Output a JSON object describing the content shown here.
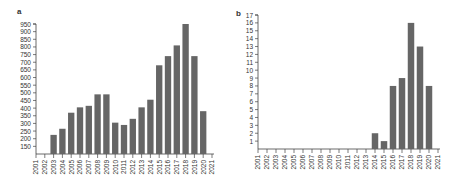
{
  "chart_data": [
    {
      "panel": "a",
      "type": "bar",
      "title": "",
      "xlabel": "",
      "ylabel": "",
      "categories": [
        "2001",
        "2002",
        "2003",
        "2004",
        "2005",
        "2006",
        "2007",
        "2008",
        "2009",
        "2010",
        "2011",
        "2012",
        "2013",
        "2014",
        "2015",
        "2016",
        "2017",
        "2018",
        "2019",
        "2020",
        "2021"
      ],
      "values": [
        null,
        null,
        225,
        265,
        370,
        405,
        415,
        490,
        490,
        305,
        290,
        330,
        405,
        455,
        680,
        740,
        810,
        950,
        740,
        380,
        null
      ],
      "yticks": [
        150,
        200,
        250,
        300,
        350,
        400,
        450,
        500,
        550,
        600,
        650,
        700,
        750,
        800,
        850,
        900,
        950
      ],
      "ylim": [
        100,
        960
      ],
      "grid": false,
      "bar_color": "#666666"
    },
    {
      "panel": "b",
      "type": "bar",
      "title": "",
      "xlabel": "",
      "ylabel": "",
      "categories": [
        "2001",
        "2002",
        "2003",
        "2004",
        "2005",
        "2006",
        "2007",
        "2008",
        "2009",
        "2010",
        "2011",
        "2012",
        "2013",
        "2014",
        "2015",
        "2016",
        "2017",
        "2018",
        "2019",
        "2020",
        "2021"
      ],
      "values": [
        0,
        0,
        0,
        0,
        0,
        0,
        0,
        0,
        0,
        0,
        0,
        0,
        0,
        2,
        1,
        8,
        9,
        16,
        13,
        8,
        null
      ],
      "yticks": [
        1,
        2,
        3,
        4,
        5,
        6,
        7,
        8,
        9,
        10,
        11,
        12,
        13,
        14,
        15,
        16,
        17
      ],
      "ylim": [
        0,
        17
      ],
      "grid": false,
      "bar_color": "#666666"
    }
  ],
  "panels": {
    "a": {
      "label": "a"
    },
    "b": {
      "label": "b"
    }
  }
}
